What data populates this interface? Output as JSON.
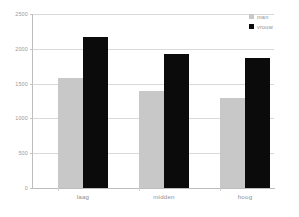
{
  "chart_data": {
    "type": "bar",
    "title": "",
    "subtitle": "",
    "xlabel": "",
    "ylabel": "",
    "categories": [
      "laag",
      "midden",
      "hoog"
    ],
    "series": [
      {
        "name": "man",
        "color": "#c8c8c8",
        "values": [
          1580,
          1395,
          1295
        ]
      },
      {
        "name": "vrouw",
        "color": "#0b0b0b",
        "values": [
          2170,
          1925,
          1870
        ]
      }
    ],
    "ylim": [
      0,
      2500
    ],
    "yticks": [
      0,
      500,
      1000,
      1500,
      2000,
      2500
    ],
    "ytick_labels": [
      "0",
      "500",
      "1000",
      "1500",
      "2000",
      "2500"
    ],
    "grid": true,
    "grid_axis": "y",
    "legend_position": "top-right",
    "background": "#ffffff",
    "gridline_color": "#d9d9d9",
    "axis_color": "#bdbdbd",
    "tick_label_color": "#9a9a9a"
  },
  "legend": {
    "items": [
      {
        "label": "man"
      },
      {
        "label": "vrouw"
      }
    ]
  }
}
